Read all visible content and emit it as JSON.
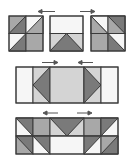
{
  "diagram": {
    "colors": {
      "dark": "#7a7a7a",
      "medium": "#a8a8a8",
      "light": "#d4d4d4",
      "white": "#f6f6f6",
      "line": "#3a3a3a",
      "arrow": "#555555"
    },
    "rows": [
      {
        "id": "row-1",
        "description": "Three separate units with arrows showing they join together",
        "arrows": [
          "left",
          "right"
        ],
        "units": [
          {
            "id": "left-unit",
            "type": "four-patch of half-square triangles"
          },
          {
            "id": "center-unit",
            "type": "rectangle over flying-geese"
          },
          {
            "id": "right-unit",
            "type": "four-patch of half-square triangles (mirrored)"
          }
        ]
      },
      {
        "id": "row-2",
        "description": "Center strip with flying-geese triangles pointing outward",
        "arrows": [
          "right",
          "left"
        ]
      },
      {
        "id": "row-3",
        "description": "Bottom strip of half-square triangles and flying geese",
        "arrows": [
          "left",
          "right"
        ]
      }
    ]
  }
}
